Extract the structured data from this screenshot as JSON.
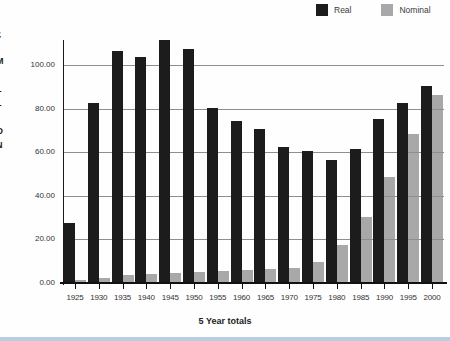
{
  "legend": {
    "items": [
      {
        "label": "Real",
        "color": "#1c1c1c"
      },
      {
        "label": "Nominal",
        "color": "#a8a8a8"
      }
    ]
  },
  "chart_data": {
    "type": "bar",
    "title": "",
    "xlabel": "5 Year totals",
    "ylabel": "£ MILLION",
    "ylim": [
      0,
      112
    ],
    "yticks": [
      "0.00",
      "20.00",
      "40.00",
      "60.00",
      "80.00",
      "100.00"
    ],
    "grid": true,
    "legend_position": "top-right",
    "categories": [
      "1925",
      "1930",
      "1935",
      "1940",
      "1945",
      "1950",
      "1955",
      "1960",
      "1965",
      "1970",
      "1975",
      "1980",
      "1985",
      "1990",
      "1995",
      "2000"
    ],
    "series": [
      {
        "name": "Real",
        "color": "#1c1c1c",
        "values": [
          27,
          82,
          106,
          103,
          111,
          107,
          80,
          74,
          70,
          62,
          60,
          56,
          61,
          75,
          82,
          90
        ]
      },
      {
        "name": "Nominal",
        "color": "#a8a8a8",
        "values": [
          1,
          2,
          3,
          3.5,
          4,
          4.5,
          5,
          5.5,
          6,
          6.5,
          9,
          17,
          30,
          48,
          68,
          86
        ]
      }
    ]
  },
  "colors": {
    "background": "#fefefe",
    "gridline": "#8e8e8e",
    "axis": "#111111",
    "text": "#333333",
    "bottom_edge_strip": "#b7cee4"
  }
}
